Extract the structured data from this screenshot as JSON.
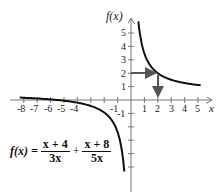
{
  "chart_data": {
    "type": "line",
    "title": "",
    "xlabel": "x",
    "ylabel": "f(x)",
    "function": "f(x) = (x + 4)/(3x) + (x + 8)/(5x)",
    "simplified": "f(x) = 8/15 + 44/(15x)",
    "xlim": [
      -8,
      5
    ],
    "ylim": [
      -6,
      5
    ],
    "x_ticks": [
      -8,
      -7,
      -6,
      -5,
      -4,
      -3,
      -2,
      -1,
      1,
      2,
      3,
      4,
      5
    ],
    "x_tick_labels": [
      "-8",
      "-7",
      "-6",
      "-5",
      "-4",
      "-1",
      "1",
      "2",
      "3",
      "4",
      "5"
    ],
    "y_ticks": [
      -5,
      -4,
      -3,
      -2,
      -1,
      1,
      2,
      3,
      4,
      5
    ],
    "y_tick_labels": [
      "-1",
      "1",
      "2",
      "3",
      "4",
      "5"
    ],
    "vertical_asymptote": 0,
    "horizontal_asymptote": 0.5333,
    "annotation": {
      "point": [
        2,
        2
      ],
      "arrows": [
        "from y-axis at f(x)=2 right to curve",
        "from curve down to x=2"
      ]
    },
    "grid": false,
    "series": [
      {
        "name": "f(x) branch x>0",
        "x": [
          0.6,
          1,
          1.5,
          2,
          3,
          4,
          5
        ],
        "y": [
          5.42,
          3.47,
          2.49,
          2.0,
          1.51,
          1.27,
          1.12
        ]
      },
      {
        "name": "f(x) branch x<0",
        "x": [
          -8,
          -6,
          -5,
          -4,
          -3,
          -2,
          -1,
          -0.5
        ],
        "y": [
          0.17,
          0.04,
          -0.05,
          -0.2,
          -0.44,
          -0.93,
          -2.4,
          -5.33
        ]
      }
    ]
  },
  "labels": {
    "y_axis": "f(x)",
    "x_axis": "x",
    "x_neg": [
      "-8",
      "-7",
      "-6",
      "-5",
      "-4"
    ],
    "x_neg1": "-1",
    "x_pos": [
      "1",
      "2",
      "3",
      "4",
      "5"
    ],
    "y_pos": [
      "1",
      "2",
      "3",
      "4",
      "5"
    ],
    "y_neg1": "-1"
  },
  "formula": {
    "lhs": "f(x) =",
    "frac1_num": "x + 4",
    "frac1_den": "3x",
    "plus": "+",
    "frac2_num": "x + 8",
    "frac2_den": "5x"
  },
  "colors": {
    "curve": "#111111",
    "axis": "#777777",
    "arrow": "#555555"
  }
}
